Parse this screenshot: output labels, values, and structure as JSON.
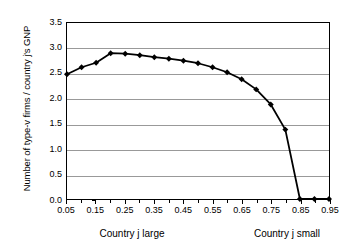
{
  "chart_data": {
    "type": "line",
    "title": "",
    "xlabel": "",
    "ylabel": "Number of type-v firms / country j's GNP",
    "xlabel_left": "Country j large",
    "xlabel_right": "Country j small",
    "x": [
      0.05,
      0.1,
      0.15,
      0.2,
      0.25,
      0.3,
      0.35,
      0.4,
      0.45,
      0.5,
      0.55,
      0.6,
      0.65,
      0.7,
      0.75,
      0.8,
      0.85,
      0.9,
      0.95
    ],
    "values": [
      2.48,
      2.62,
      2.71,
      2.9,
      2.89,
      2.86,
      2.82,
      2.79,
      2.75,
      2.7,
      2.62,
      2.52,
      2.38,
      2.18,
      1.88,
      1.38,
      0.0,
      0.0,
      0.0
    ],
    "series": [
      {
        "name": "type-v firms per GNP",
        "values": [
          2.48,
          2.62,
          2.71,
          2.9,
          2.89,
          2.86,
          2.82,
          2.79,
          2.75,
          2.7,
          2.62,
          2.52,
          2.38,
          2.18,
          1.88,
          1.38,
          0.0,
          0.0,
          0.0
        ]
      }
    ],
    "ylim": [
      0.0,
      3.5
    ],
    "xlim": [
      0.05,
      0.95
    ],
    "yticks": [
      "0.0",
      "0.5",
      "1.0",
      "1.5",
      "2.0",
      "2.5",
      "3.0",
      "3.5"
    ],
    "ytick_values": [
      0.0,
      0.5,
      1.0,
      1.5,
      2.0,
      2.5,
      3.0,
      3.5
    ],
    "xticks": [
      "0.05",
      "0.15",
      "0.25",
      "0.35",
      "0.45",
      "0.55",
      "0.65",
      "0.75",
      "0.85",
      "0.95"
    ],
    "xtick_values": [
      0.05,
      0.15,
      0.25,
      0.35,
      0.45,
      0.55,
      0.65,
      0.75,
      0.85,
      0.95
    ],
    "xtick_minor_values": [
      0.1,
      0.2,
      0.3,
      0.4,
      0.5,
      0.6,
      0.7,
      0.8,
      0.9
    ],
    "grid": "horizontal",
    "legend": "none",
    "line_color": "#000000",
    "grid_color": "#999999",
    "marker": "diamond",
    "marker_color": "#000000",
    "background": "#ffffff"
  }
}
